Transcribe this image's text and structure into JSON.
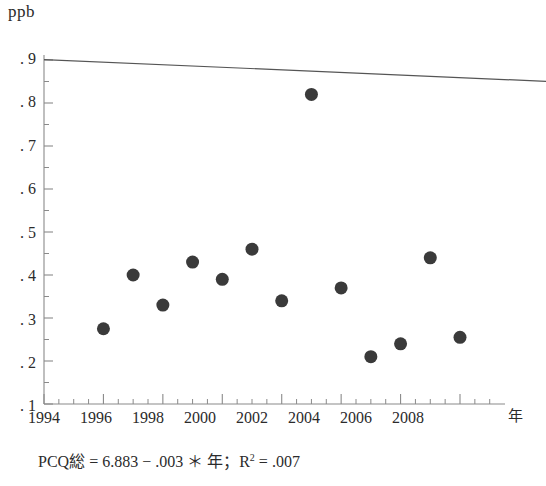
{
  "chart_data": {
    "type": "scatter",
    "title": "",
    "ylabel": "ppb",
    "xlabel": "年",
    "xlim": [
      1994,
      2009.5
    ],
    "ylim": [
      0.1,
      0.9
    ],
    "grid": false,
    "legend": "none",
    "x_tick_labels": [
      "1994",
      "1996",
      "1998",
      "2000",
      "2002",
      "2004",
      "2006",
      "2008"
    ],
    "x_ticks": [
      1994,
      1996,
      1998,
      2000,
      2002,
      2004,
      2006,
      2008
    ],
    "x_minor_tick_step": 0.5,
    "y_tick_labels": [
      ". 9",
      ". 8",
      ". 7",
      ". 6",
      ". 5",
      ". 4",
      ". 3",
      ". 2",
      ". 1"
    ],
    "y_ticks": [
      0.9,
      0.8,
      0.7,
      0.6,
      0.5,
      0.4,
      0.3,
      0.2,
      0.1
    ],
    "y_minor_tick_step": 0.05,
    "x": [
      1996,
      1997,
      1998,
      1999,
      2000,
      2001,
      2002,
      2003,
      2004,
      2005,
      2006,
      2007,
      2008
    ],
    "values": [
      0.275,
      0.4,
      0.33,
      0.43,
      0.39,
      0.46,
      0.34,
      0.82,
      0.37,
      0.21,
      0.24,
      0.44,
      0.255
    ],
    "series": [
      {
        "name": "PCQ総",
        "marker": "filled-circle",
        "marker_color": "#3a3a3a",
        "marker_size_px": 13,
        "points": [
          {
            "x": 1996,
            "y": 0.275
          },
          {
            "x": 1997,
            "y": 0.4
          },
          {
            "x": 1998,
            "y": 0.33
          },
          {
            "x": 1999,
            "y": 0.43
          },
          {
            "x": 2000,
            "y": 0.39
          },
          {
            "x": 2001,
            "y": 0.46
          },
          {
            "x": 2002,
            "y": 0.34
          },
          {
            "x": 2003,
            "y": 0.82
          },
          {
            "x": 2004,
            "y": 0.37
          },
          {
            "x": 2005,
            "y": 0.21
          },
          {
            "x": 2006,
            "y": 0.24
          },
          {
            "x": 2007,
            "y": 0.44
          },
          {
            "x": 2008,
            "y": 0.255
          }
        ]
      }
    ],
    "trendline": {
      "type": "linear-fit",
      "intercept": 6.883,
      "slope": -0.003,
      "r_squared": 0.007,
      "x_start": 1994,
      "x_end": 2011.2,
      "color": "#555555"
    },
    "annotations": [
      {
        "name": "regression-equation",
        "text": "PCQ総 = 6.883 − .003 ＊ 年；R2 = .007"
      }
    ]
  },
  "axes": {
    "y_unit_label": "ppb",
    "x_axis_title": "年",
    "y_tick_labels": [
      ". 9",
      ". 8",
      ". 7",
      ". 6",
      ". 5",
      ". 4",
      ". 3",
      ". 2",
      ". 1"
    ],
    "x_tick_labels": [
      "1994",
      "1996",
      "1998",
      "2000",
      "2002",
      "2004",
      "2006",
      "2008"
    ]
  },
  "equation": {
    "lhs": "PCQ総",
    "eq1": "=",
    "intercept": "6.883",
    "minus": "−",
    "slope": ".003",
    "times": "＊",
    "variable": "年",
    "semicolon": "；",
    "r_symbol": "R",
    "r_exponent": "2",
    "eq2": "=",
    "r_value": ".007",
    "full": "PCQ総 = 6.883 − .003 ＊ 年；R2 = .007"
  },
  "colors": {
    "marker": "#3a3a3a",
    "trendline": "#555555",
    "axis": "#8a8a8a",
    "text": "#2b2b2b",
    "background": "#ffffff"
  }
}
